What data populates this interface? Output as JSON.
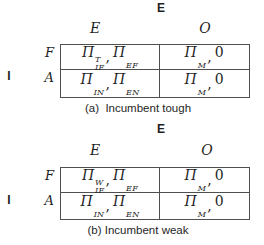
{
  "colors": {
    "bg": "#ffffff",
    "ink": "#1f1f1f",
    "line": "#4f4f4f"
  },
  "games": [
    {
      "column_player_label": "E",
      "row_player_label": "I",
      "column_headers": [
        "E",
        "O"
      ],
      "row_headers": [
        "F",
        "A"
      ],
      "caption": "(a)  Incumbent tough",
      "cells": {
        "r0c0": {
          "p1": {
            "base": "Π",
            "sup": "T",
            "sub": "IF"
          },
          "sep": ",",
          "p2": {
            "base": "Π",
            "sup": "",
            "sub": "EF"
          }
        },
        "r0c1": {
          "p1": {
            "base": "Π",
            "sup": "",
            "sub": "M"
          },
          "sep": ",",
          "p2": {
            "base": "0",
            "sup": "",
            "sub": ""
          }
        },
        "r1c0": {
          "p1": {
            "base": "Π",
            "sup": "",
            "sub": "IN"
          },
          "sep": ",",
          "p2": {
            "base": "Π",
            "sup": "",
            "sub": "EN"
          }
        },
        "r1c1": {
          "p1": {
            "base": "Π",
            "sup": "",
            "sub": "M"
          },
          "sep": ",",
          "p2": {
            "base": "0",
            "sup": "",
            "sub": ""
          }
        }
      }
    },
    {
      "column_player_label": "E",
      "row_player_label": "I",
      "column_headers": [
        "E",
        "O"
      ],
      "row_headers": [
        "F",
        "A"
      ],
      "caption": "(b) Incumbent weak",
      "cells": {
        "r0c0": {
          "p1": {
            "base": "Π",
            "sup": "W",
            "sub": "IF"
          },
          "sep": ",",
          "p2": {
            "base": "Π",
            "sup": "",
            "sub": "EF"
          }
        },
        "r0c1": {
          "p1": {
            "base": "Π",
            "sup": "",
            "sub": "M"
          },
          "sep": ",",
          "p2": {
            "base": "0",
            "sup": "",
            "sub": ""
          }
        },
        "r1c0": {
          "p1": {
            "base": "Π",
            "sup": "",
            "sub": "IN"
          },
          "sep": ",",
          "p2": {
            "base": "Π",
            "sup": "",
            "sub": "EN"
          }
        },
        "r1c1": {
          "p1": {
            "base": "Π",
            "sup": "",
            "sub": "M"
          },
          "sep": ",",
          "p2": {
            "base": "0",
            "sup": "",
            "sub": ""
          }
        }
      }
    }
  ]
}
